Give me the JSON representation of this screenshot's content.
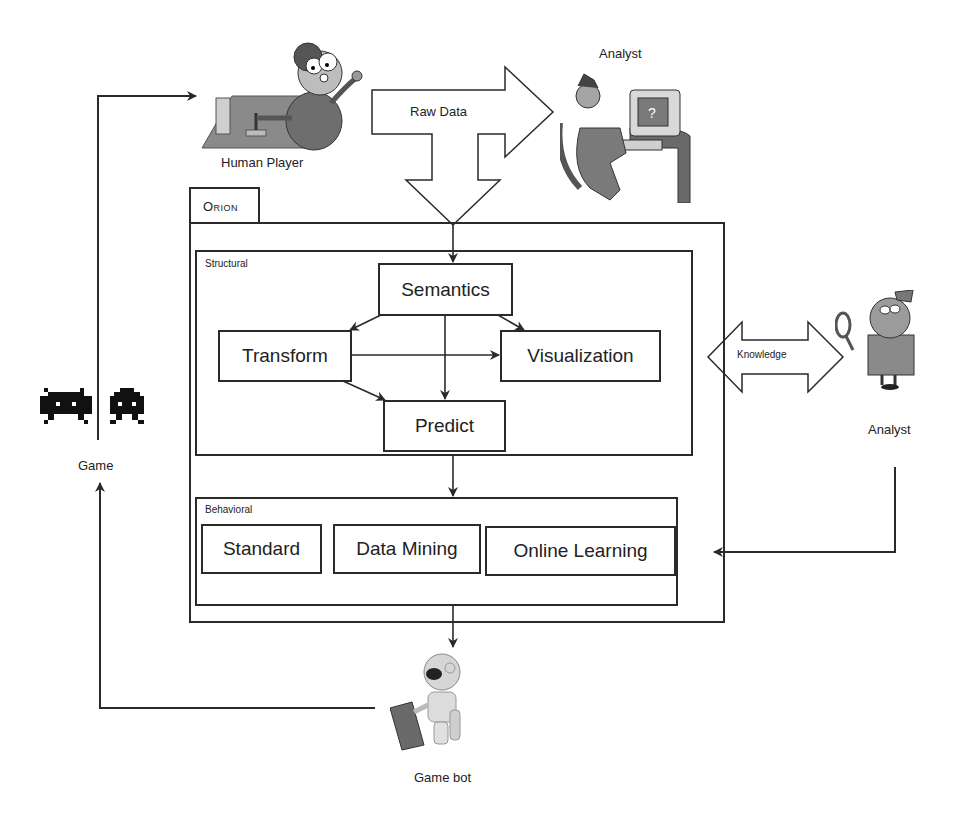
{
  "diagram": {
    "system_name": "Orion",
    "actors": {
      "human_player": "Human Player",
      "analyst_top": "Analyst",
      "analyst_right": "Analyst",
      "game": "Game",
      "game_bot": "Game bot"
    },
    "flows": {
      "raw_data": "Raw Data",
      "knowledge": "Knowledge"
    },
    "structural": {
      "title": "Structural",
      "modules": [
        "Semantics",
        "Transform",
        "Visualization",
        "Predict"
      ]
    },
    "behavioral": {
      "title": "Behavioral",
      "modules": [
        "Standard",
        "Data Mining",
        "Online Learning"
      ]
    },
    "colors": {
      "line": "#2a2a2a",
      "figure_gray": "#7a7a7a",
      "background": "#ffffff"
    }
  }
}
